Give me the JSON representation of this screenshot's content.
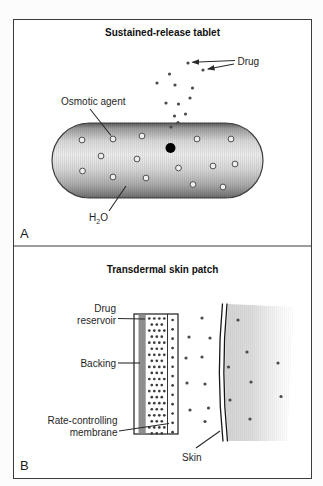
{
  "figure": {
    "panel_a": {
      "tag": "A",
      "title": "Sustained-release tablet",
      "labels": {
        "drug": "Drug",
        "osmotic_agent": "Osmotic agent",
        "water_h": "H",
        "water_sub": "2",
        "water_o": "O"
      },
      "drug_particles": [
        [
          188,
          63
        ],
        [
          203,
          70
        ],
        [
          169.5,
          74
        ],
        [
          157,
          83
        ],
        [
          175,
          85
        ],
        [
          192.5,
          88
        ],
        [
          190,
          98
        ],
        [
          166,
          103
        ],
        [
          178.5,
          104
        ],
        [
          185.5,
          114
        ],
        [
          174.5,
          116
        ],
        [
          178,
          122.5
        ],
        [
          171,
          127
        ]
      ],
      "osmotic_agent_circles": [
        [
          82,
          140
        ],
        [
          113,
          139
        ],
        [
          142,
          136
        ],
        [
          197,
          139
        ],
        [
          231,
          139
        ],
        [
          101,
          156
        ],
        [
          137,
          159
        ],
        [
          178.5,
          168
        ],
        [
          213,
          166
        ],
        [
          235,
          164
        ],
        [
          82.5,
          171
        ],
        [
          113,
          177
        ],
        [
          146,
          178
        ],
        [
          193,
          184.5
        ],
        [
          223,
          187
        ]
      ]
    },
    "panel_b": {
      "tag": "B",
      "title": "Transdermal skin patch",
      "labels": {
        "drug_reservoir_line1": "Drug",
        "drug_reservoir_line2": "reservoir",
        "backing": "Backing",
        "rate_membrane_line1": "Rate-controlling",
        "rate_membrane_line2": "membrane",
        "skin": "Skin"
      },
      "reservoir_grid": {
        "y0": 318.5,
        "step": 6.05,
        "rows": 20,
        "r": 1.35,
        "patterns": [
          [
            149.3,
            154.3,
            159.3,
            164.3
          ],
          [
            151.8,
            156.8,
            161.8
          ]
        ]
      },
      "membrane_grid": {
        "y0": 320,
        "step": 9.35,
        "rows": 13,
        "r": 1.35,
        "patterns": [
          [
            172.6
          ]
        ]
      },
      "transit_particles": [
        [
          202,
          318
        ],
        [
          189,
          337
        ],
        [
          210,
          338
        ],
        [
          186,
          358
        ],
        [
          202,
          357
        ],
        [
          187,
          383
        ],
        [
          205,
          384
        ],
        [
          190,
          410
        ],
        [
          208.5,
          408
        ],
        [
          205,
          421.5
        ]
      ],
      "skin_particles": [
        [
          238,
          320
        ],
        [
          247,
          352
        ],
        [
          228.5,
          367
        ],
        [
          278,
          363
        ],
        [
          251,
          382
        ],
        [
          230,
          400
        ],
        [
          281,
          396.5
        ],
        [
          250,
          419
        ]
      ]
    },
    "colors": {
      "particle": "#4a4a4a",
      "backing_fill": "#8e8e8e",
      "leader_line": "#2a2a2a",
      "frame_stroke": "#3b3b3b"
    }
  }
}
